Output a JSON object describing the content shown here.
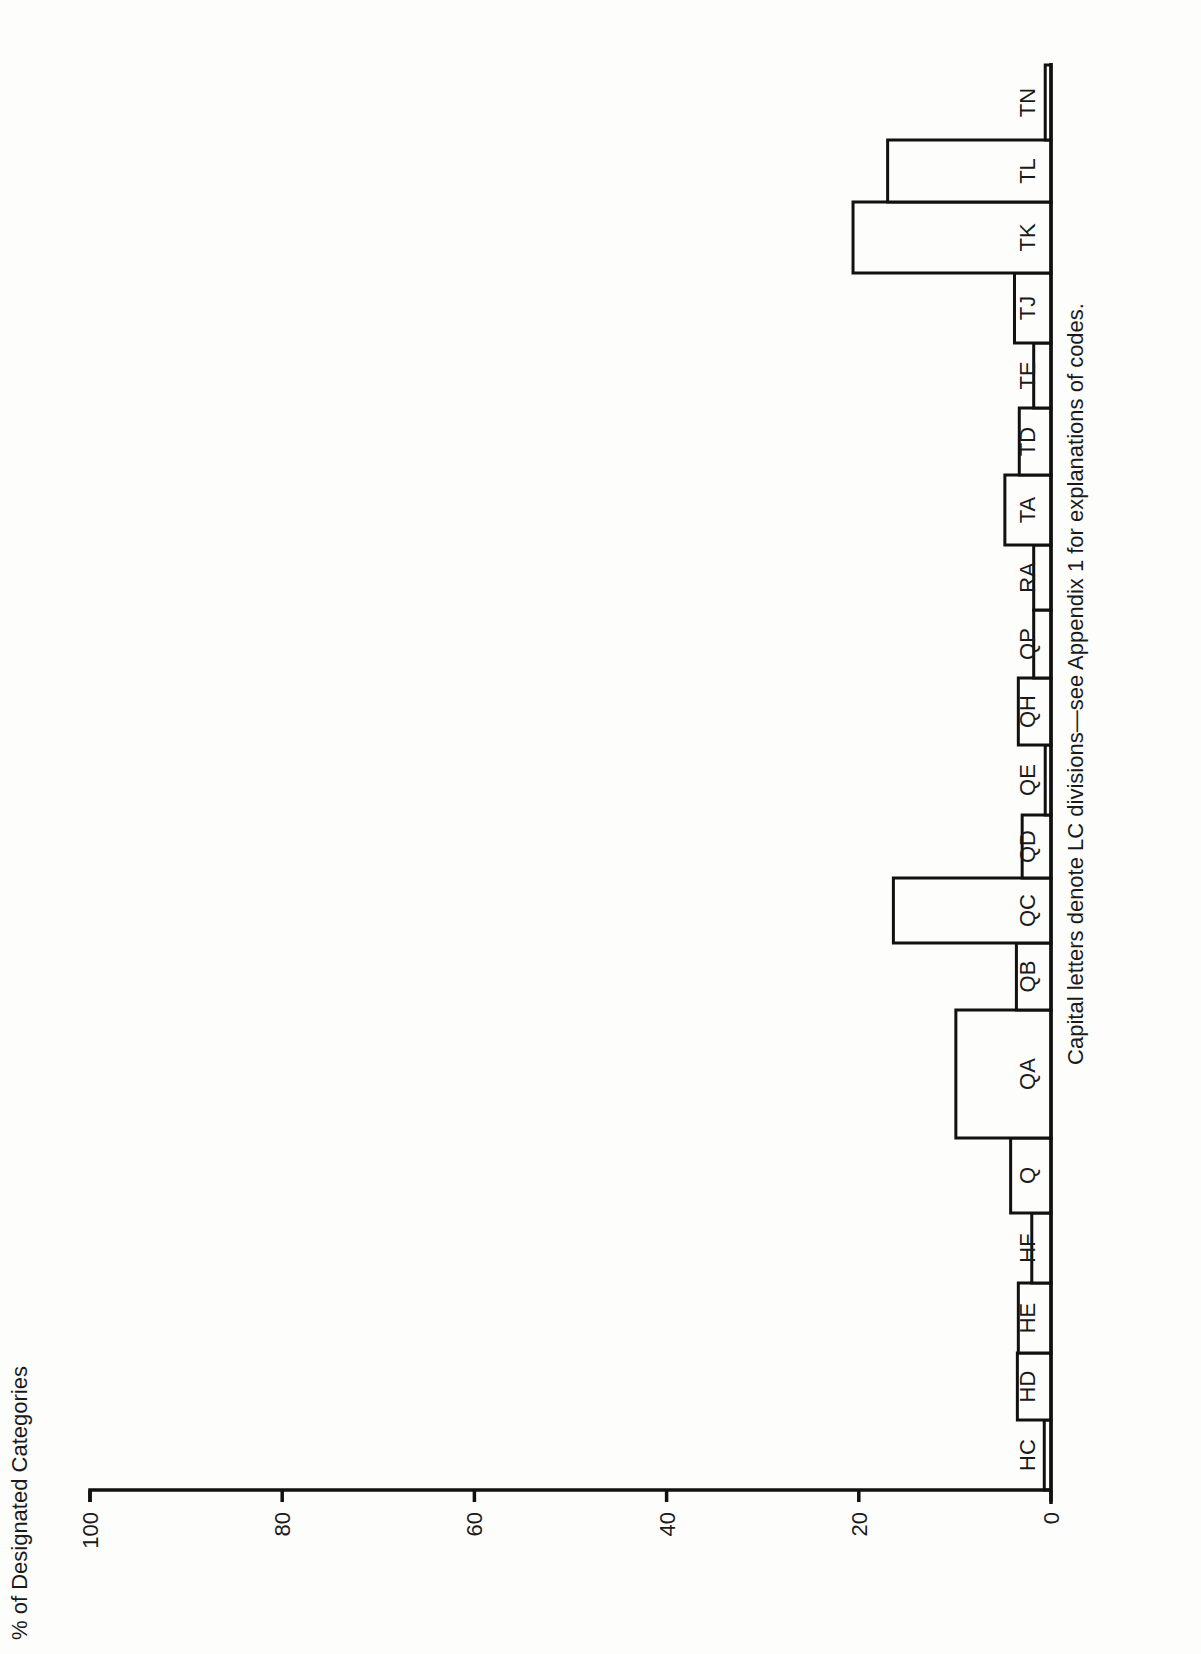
{
  "chart_data": {
    "type": "bar",
    "orientation": "page rotated 90deg (vertical bars drawn sideways)",
    "title": "",
    "ylabel": "% of Designated Categories",
    "xlabel": "Capital letters denote LC divisions—see Appendix 1 for explanations of codes.",
    "ylim": [
      0,
      100
    ],
    "yticks": [
      0,
      20,
      40,
      60,
      80,
      100
    ],
    "grid": false,
    "legend": null,
    "categories": [
      "HC",
      "HD",
      "HE",
      "HF",
      "Q",
      "QA",
      "QB",
      "QC",
      "QD",
      "QE",
      "QH",
      "QP",
      "RA",
      "TA",
      "TD",
      "TE",
      "TJ",
      "TK",
      "TL",
      "TN"
    ],
    "values": [
      0.7,
      3.5,
      3.4,
      2.0,
      4.2,
      9.9,
      3.6,
      16.4,
      3.0,
      0.6,
      3.4,
      1.8,
      1.8,
      4.8,
      3.3,
      1.8,
      3.8,
      20.6,
      17.0,
      0.6
    ]
  },
  "layout": {
    "baseline_x": 1051,
    "px_per_unit": 9.61,
    "axis_y": 1490,
    "bar_edges_y": [
      1490,
      1420,
      1353,
      1283,
      1213,
      1138,
      1010,
      943,
      878,
      815,
      745,
      678,
      610,
      545,
      475,
      408,
      343,
      273,
      202,
      140,
      65
    ],
    "label_x": 1035
  },
  "text": {
    "ylabel": "% of Designated Categories",
    "xlabel": "Capital letters denote LC divisions—see Appendix 1 for explanations of codes."
  }
}
